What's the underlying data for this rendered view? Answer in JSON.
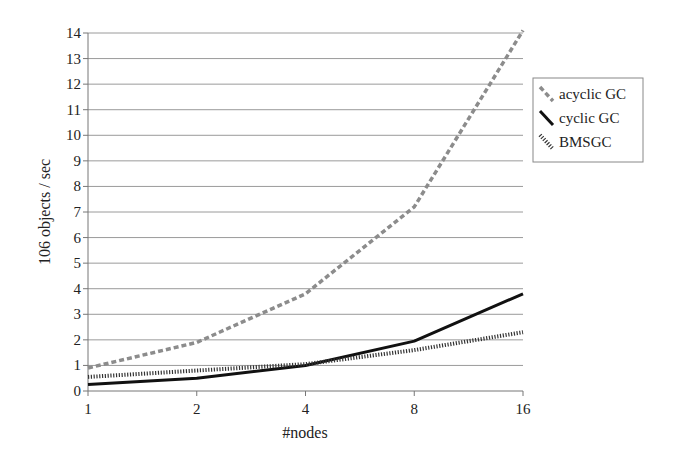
{
  "chart_data": {
    "type": "line",
    "title": "",
    "xlabel": "#nodes",
    "ylabel": "106 objects / sec",
    "categories": [
      "1",
      "2",
      "4",
      "8",
      "16"
    ],
    "ylim": [
      0,
      14
    ],
    "yticks": [
      0,
      1,
      2,
      3,
      4,
      5,
      6,
      7,
      8,
      9,
      10,
      11,
      12,
      13,
      14
    ],
    "grid": true,
    "legend_position": "right",
    "series": [
      {
        "name": "acyclic GC",
        "values": [
          0.9,
          1.9,
          3.8,
          7.2,
          14.1
        ],
        "color": "#8c8c8c",
        "style": "dashed-gray"
      },
      {
        "name": "cyclic GC",
        "values": [
          0.25,
          0.5,
          1.0,
          1.95,
          3.8
        ],
        "color": "#111111",
        "style": "solid"
      },
      {
        "name": "BMSGC",
        "values": [
          0.55,
          0.8,
          1.05,
          1.6,
          2.3
        ],
        "color": "#333333",
        "style": "dotted-dense"
      }
    ]
  }
}
